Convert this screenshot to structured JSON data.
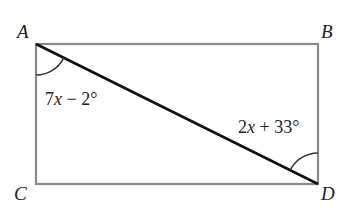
{
  "figure": {
    "type": "rectangle-with-diagonal",
    "vertices": {
      "A": {
        "label": "A",
        "position": "top-left"
      },
      "B": {
        "label": "B",
        "position": "top-right"
      },
      "C": {
        "label": "C",
        "position": "bottom-left"
      },
      "D": {
        "label": "D",
        "position": "bottom-right"
      }
    },
    "diagonal": "AD",
    "angles": [
      {
        "vertex": "A",
        "expr_coef": "7",
        "expr_var": "x",
        "expr_rest": " − 2°",
        "text": "7x − 2°"
      },
      {
        "vertex": "D",
        "expr_coef": "2",
        "expr_var": "x",
        "expr_rest": " + 33°",
        "text": "2x + 33°"
      }
    ],
    "colors": {
      "rectangle": "#8a8a8a",
      "diagonal": "#111111",
      "arc": "#333333",
      "text": "#222222"
    }
  }
}
